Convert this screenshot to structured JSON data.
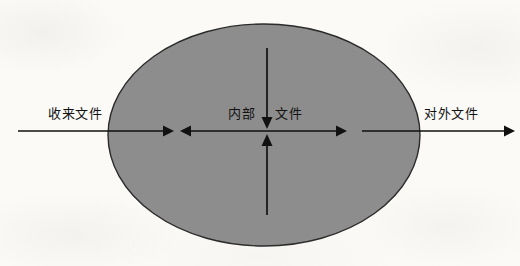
{
  "diagram": {
    "type": "flow-diagram",
    "canvas": {
      "width": 520,
      "height": 266
    },
    "background_color": "#fbfaf7",
    "shape": {
      "name": "organization-boundary-ellipse",
      "kind": "ellipse",
      "center_x": 264,
      "center_y": 135,
      "radius_x": 156,
      "radius_y": 111,
      "fill_color": "#8d8d8d",
      "stroke_color": "#2b2b2b"
    },
    "labels": {
      "incoming": "收来文件",
      "internal": "内部",
      "document": "文件",
      "outgoing": "对外文件"
    },
    "arrows": [
      {
        "name": "incoming-arrow",
        "label": "收来文件",
        "direction": "right",
        "from": [
          18,
          131
        ],
        "to": [
          170,
          131
        ]
      },
      {
        "name": "internal-left-arrow",
        "label": "内部",
        "direction": "left",
        "from": [
          264,
          131
        ],
        "to": [
          184,
          131
        ]
      },
      {
        "name": "internal-right-arrow",
        "label": "文件",
        "direction": "right",
        "from": [
          264,
          131
        ],
        "to": [
          343,
          131
        ]
      },
      {
        "name": "outgoing-arrow",
        "label": "对外文件",
        "direction": "right",
        "from": [
          362,
          131
        ],
        "to": [
          513,
          131
        ]
      },
      {
        "name": "internal-down-arrow",
        "label": "内部文件",
        "direction": "down",
        "from": [
          267,
          48
        ],
        "to": [
          267,
          131
        ]
      },
      {
        "name": "internal-up-arrow",
        "label": "内部文件",
        "direction": "up",
        "from": [
          267,
          215
        ],
        "to": [
          267,
          131
        ]
      }
    ]
  }
}
